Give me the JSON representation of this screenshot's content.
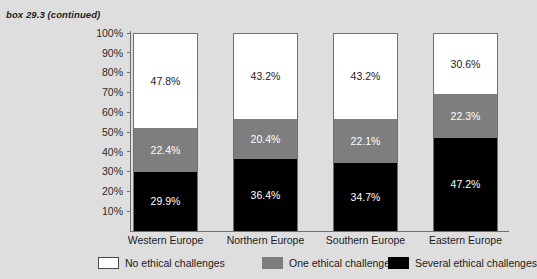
{
  "caption": "box 29.3 (continued)",
  "chart_data": {
    "type": "bar",
    "subtype": "stacked-100-percent",
    "title": "box 29.3 (continued)",
    "xlabel": "",
    "ylabel": "",
    "ylim": [
      0,
      100
    ],
    "grid": false,
    "legend_position": "bottom",
    "categories": [
      "Western Europe",
      "Northern Europe",
      "Southern Europe",
      "Eastern Europe"
    ],
    "ytick_labels": [
      "100%",
      "90%",
      "80%",
      "70%",
      "60%",
      "50%",
      "40%",
      "30%",
      "20%",
      "10%"
    ],
    "ytick_values": [
      100,
      90,
      80,
      70,
      60,
      50,
      40,
      30,
      20,
      10
    ],
    "series": [
      {
        "name": "No ethical challenges",
        "color": "#ffffff",
        "values": [
          47.8,
          43.2,
          43.2,
          30.6
        ],
        "labels": [
          "47.8%",
          "43.2%",
          "43.2%",
          "30.6%"
        ]
      },
      {
        "name": "One ethical challenge",
        "color": "#7e7e7e",
        "values": [
          22.4,
          20.4,
          22.1,
          22.3
        ],
        "labels": [
          "22.4%",
          "20.4%",
          "22.1%",
          "22.3%"
        ]
      },
      {
        "name": "Several ethical challenges",
        "color": "#000000",
        "values": [
          29.9,
          36.4,
          34.7,
          47.2
        ],
        "labels": [
          "29.9%",
          "36.4%",
          "34.7%",
          "47.2%"
        ]
      }
    ]
  },
  "legend": [
    {
      "label": "No ethical challenges",
      "color": "#ffffff"
    },
    {
      "label": "One ethical challenge",
      "color": "#7e7e7e"
    },
    {
      "label": "Several ethical challenges",
      "color": "#000000"
    }
  ]
}
